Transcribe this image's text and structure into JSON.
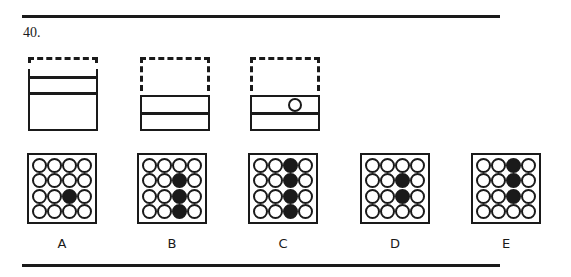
{
  "question": {
    "number": "40."
  },
  "stems": [
    {
      "id": "stem-1",
      "x": 28,
      "type": "tall",
      "ball": false
    },
    {
      "id": "stem-2",
      "x": 140,
      "type": "short",
      "ball": false
    },
    {
      "id": "stem-3",
      "x": 250,
      "type": "short",
      "ball": true
    }
  ],
  "options": [
    {
      "label": "A",
      "x": 27,
      "filled": [
        [
          2,
          2
        ]
      ]
    },
    {
      "label": "B",
      "x": 137,
      "filled": [
        [
          1,
          2
        ],
        [
          2,
          2
        ],
        [
          3,
          2
        ]
      ]
    },
    {
      "label": "C",
      "x": 248,
      "filled": [
        [
          0,
          2
        ],
        [
          1,
          2
        ],
        [
          2,
          2
        ],
        [
          3,
          2
        ]
      ]
    },
    {
      "label": "D",
      "x": 360,
      "filled": [
        [
          1,
          2
        ],
        [
          2,
          2
        ]
      ]
    },
    {
      "label": "E",
      "x": 471,
      "filled": [
        [
          0,
          2
        ],
        [
          1,
          2
        ],
        [
          2,
          2
        ]
      ]
    }
  ],
  "grid": {
    "rows": 4,
    "cols": 4
  },
  "colors": {
    "ink": "#1a1a1a",
    "background": "#ffffff"
  }
}
